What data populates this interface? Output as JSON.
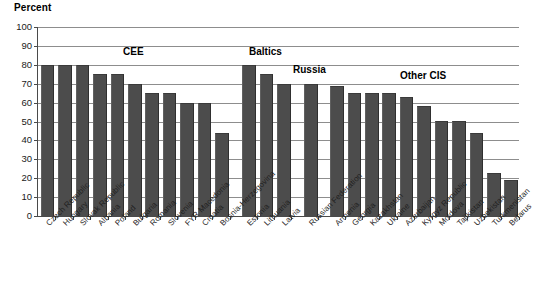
{
  "chart_data": {
    "type": "bar",
    "title": "",
    "ylabel": "Percent",
    "xlabel": "",
    "ylim": [
      0,
      100
    ],
    "ytick_step": 10,
    "yticks": [
      100,
      90,
      80,
      70,
      60,
      50,
      40,
      30,
      20,
      10,
      0
    ],
    "grid": true,
    "legend": "none",
    "bar_color": "#4c4c4c",
    "categories": [
      "Czech Republic",
      "Hungary",
      "Slovak Republic",
      "Albania",
      "Poland",
      "Bulgaria",
      "Romania",
      "Slovenia",
      "FYR Macedonia",
      "Croatia",
      "Bosnia-Herzegovina",
      "Estonia",
      "Lithuania",
      "Latvia",
      "Russian Federation",
      "Armenia",
      "Georgia",
      "Kazakhstan",
      "Ukraine",
      "Azerbaijan",
      "Kyrgyz Republic",
      "Moldova",
      "Tajikistan",
      "Uzbekistan",
      "Turkmenistan",
      "Belarus"
    ],
    "values": [
      80,
      80,
      80,
      75,
      75,
      70,
      65,
      65,
      60,
      60,
      44,
      80,
      75,
      70,
      70,
      69,
      65,
      65,
      65,
      63,
      58,
      50,
      50,
      44,
      23,
      19
    ],
    "groups": [
      {
        "label": "CEE",
        "start_index": 0,
        "end_index": 10
      },
      {
        "label": "Baltics",
        "start_index": 11,
        "end_index": 13
      },
      {
        "label": "Russia",
        "start_index": 14,
        "end_index": 14
      },
      {
        "label": "Other CIS",
        "start_index": 15,
        "end_index": 25
      }
    ]
  },
  "annotations": {
    "group_labels": [
      "CEE",
      "Baltics",
      "Russia",
      "Other CIS"
    ]
  }
}
